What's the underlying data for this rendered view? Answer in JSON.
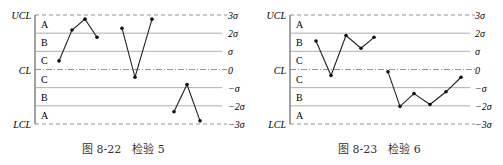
{
  "chart_data": [
    {
      "type": "line",
      "title": "检验 5",
      "caption": "图 8-22　检验 5",
      "left_labels": [
        "UCL",
        "CL",
        "LCL"
      ],
      "zone_labels": [
        "A",
        "B",
        "C",
        "C",
        "B",
        "A"
      ],
      "right_labels": [
        "3σ",
        "2σ",
        "σ",
        "0",
        "−σ",
        "−2σ",
        "−3σ"
      ],
      "ylim": [
        -3,
        3
      ],
      "series": [
        {
          "name": "run1",
          "x": [
            1,
            2,
            3,
            4
          ],
          "y": [
            0.5,
            2.2,
            2.8,
            1.8
          ]
        },
        {
          "name": "run2",
          "x": [
            6,
            7,
            8
          ],
          "y": [
            2.3,
            -0.4,
            2.8
          ]
        },
        {
          "name": "run3",
          "x": [
            9,
            10,
            11
          ],
          "y": [
            -2.3,
            -0.8,
            -2.8
          ]
        }
      ]
    },
    {
      "type": "line",
      "title": "检验 6",
      "caption": "图 8-23　检验 6",
      "left_labels": [
        "UCL",
        "CL",
        "LCL"
      ],
      "zone_labels": [
        "A",
        "B",
        "C",
        "C",
        "B",
        "A"
      ],
      "right_labels": [
        "3σ",
        "2σ",
        "σ",
        "0",
        "−σ",
        "−2σ",
        "−3σ"
      ],
      "ylim": [
        -3,
        3
      ],
      "series": [
        {
          "name": "run1",
          "x": [
            1,
            2,
            3,
            4,
            5
          ],
          "y": [
            1.6,
            -0.3,
            1.9,
            1.2,
            1.8
          ]
        },
        {
          "name": "run2",
          "x": [
            6,
            7,
            8,
            9,
            10,
            11
          ],
          "y": [
            -0.1,
            -2.0,
            -1.3,
            -1.9,
            -1.2,
            -0.4
          ]
        }
      ]
    }
  ]
}
